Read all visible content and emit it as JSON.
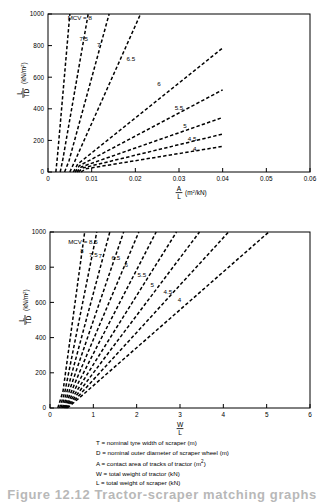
{
  "figure": {
    "caption": "Figure 12.12   Tractor-scraper matching graphs"
  },
  "legend": {
    "items": [
      {
        "symbol": "T",
        "text": "= nominal tyre width of scraper (m)",
        "sup": ""
      },
      {
        "symbol": "D",
        "text": "= nominal outer diameter of scraper wheel (m)",
        "sup": ""
      },
      {
        "symbol": "A",
        "text": "= contact area of tracks of tractor (m",
        "sup": "2",
        "tail": ")"
      },
      {
        "symbol": "W",
        "text": "= total weight of tractor (kN)",
        "sup": ""
      },
      {
        "symbol": "L",
        "text": "= total weight of scraper (kN)",
        "sup": ""
      }
    ]
  },
  "chart_data": [
    {
      "type": "line",
      "id": "upper",
      "title": "",
      "xlabel": "A/L (m2/kN)",
      "xlabel_num": "A",
      "xlabel_den": "L",
      "xlabel_units": "(m2/kN)",
      "ylabel_num": "L",
      "ylabel_den": "TD",
      "ylabel_units": "(kN/m2)",
      "annotation": "MCV = 8",
      "xlim": [
        0,
        0.06
      ],
      "ylim": [
        0,
        1000
      ],
      "xticks": [
        0,
        0.01,
        0.02,
        0.03,
        0.04,
        0.05,
        0.06
      ],
      "xticklabels": [
        "0",
        "0.01",
        "0.02",
        "0.03",
        "0.04",
        "0.05",
        "0.06"
      ],
      "yticks": [
        0,
        200,
        400,
        600,
        800,
        1000
      ],
      "yticklabels": [
        "0",
        "200",
        "400",
        "600",
        "800",
        "1000"
      ],
      "grid": false,
      "legend_position": "inline-curve-labels",
      "linestyle": "dashed",
      "series": [
        {
          "name": "8",
          "label": "MCV = 8",
          "label_xy": [
            0.0045,
            960
          ],
          "x": [
            0.0018,
            0.0022,
            0.005
          ],
          "y": [
            0,
            110,
            1000
          ]
        },
        {
          "name": "7.5",
          "label": "7.5",
          "label_xy": [
            0.0072,
            830
          ],
          "x": [
            0.0028,
            0.0034,
            0.0092
          ],
          "y": [
            0,
            80,
            1000
          ]
        },
        {
          "name": "7",
          "label": "7",
          "label_xy": [
            0.0112,
            790
          ],
          "x": [
            0.0038,
            0.0048,
            0.014
          ],
          "y": [
            0,
            70,
            1000
          ]
        },
        {
          "name": "6.5",
          "label": "6.5",
          "label_xy": [
            0.018,
            700
          ],
          "x": [
            0.005,
            0.006,
            0.0212
          ],
          "y": [
            0,
            60,
            1000
          ]
        },
        {
          "name": "6",
          "label": "6",
          "label_xy": [
            0.025,
            545
          ],
          "x": [
            0.0058,
            0.0068,
            0.04
          ],
          "y": [
            0,
            50,
            785
          ]
        },
        {
          "name": "5.5",
          "label": "5.5",
          "label_xy": [
            0.029,
            390
          ],
          "x": [
            0.0062,
            0.0072,
            0.04
          ],
          "y": [
            0,
            40,
            520
          ]
        },
        {
          "name": "5",
          "label": "5",
          "label_xy": [
            0.031,
            280
          ],
          "x": [
            0.0066,
            0.0076,
            0.04
          ],
          "y": [
            0,
            32,
            345
          ]
        },
        {
          "name": "4.5",
          "label": "4.5",
          "label_xy": [
            0.032,
            195
          ],
          "x": [
            0.007,
            0.008,
            0.04
          ],
          "y": [
            0,
            26,
            240
          ]
        },
        {
          "name": "4",
          "label": "4",
          "label_xy": [
            0.0332,
            130
          ],
          "x": [
            0.0076,
            0.0086,
            0.04
          ],
          "y": [
            0,
            20,
            162
          ]
        }
      ]
    },
    {
      "type": "line",
      "id": "lower",
      "title": "",
      "xlabel_num": "W",
      "xlabel_den": "L",
      "xlabel_units": "",
      "ylabel_num": "L",
      "ylabel_den": "TD",
      "ylabel_units": "(kN/m2)",
      "annotation": "MCV = 8.5",
      "xlim": [
        0,
        6
      ],
      "ylim": [
        0,
        1000
      ],
      "xticks": [
        0,
        1,
        2,
        3,
        4,
        5,
        6
      ],
      "xticklabels": [
        "0",
        "1",
        "2",
        "3",
        "4",
        "5",
        "6"
      ],
      "yticks": [
        0,
        200,
        400,
        600,
        800,
        1000
      ],
      "yticklabels": [
        "0",
        "200",
        "400",
        "600",
        "800",
        "1000"
      ],
      "grid": false,
      "legend_position": "inline-curve-labels",
      "linestyle": "dashed",
      "series": [
        {
          "name": "8.5",
          "label": "MCV = 8.5",
          "label_xy": [
            0.42,
            930
          ],
          "x": [
            0.18,
            0.3,
            0.8
          ],
          "y": [
            0,
            95,
            1000
          ]
        },
        {
          "name": "8",
          "label": "8",
          "label_xy": [
            0.7,
            880
          ],
          "x": [
            0.22,
            0.34,
            1.08
          ],
          "y": [
            0,
            88,
            1000
          ]
        },
        {
          "name": "7.5",
          "label": "7.5",
          "label_xy": [
            0.9,
            860
          ],
          "x": [
            0.25,
            0.38,
            1.38
          ],
          "y": [
            0,
            82,
            1000
          ]
        },
        {
          "name": "7",
          "label": "7",
          "label_xy": [
            1.12,
            855
          ],
          "x": [
            0.28,
            0.42,
            1.7
          ],
          "y": [
            0,
            78,
            1000
          ]
        },
        {
          "name": "6.5",
          "label": "6.5",
          "label_xy": [
            1.42,
            840
          ],
          "x": [
            0.3,
            0.46,
            2.05
          ],
          "y": [
            0,
            74,
            1000
          ]
        },
        {
          "name": "6",
          "label": "6",
          "label_xy": [
            1.72,
            800
          ],
          "x": [
            0.32,
            0.5,
            2.45
          ],
          "y": [
            0,
            70,
            1000
          ]
        },
        {
          "name": "5.5",
          "label": "5.5",
          "label_xy": [
            2.02,
            745
          ],
          "x": [
            0.34,
            0.54,
            2.92
          ],
          "y": [
            0,
            66,
            1000
          ]
        },
        {
          "name": "5",
          "label": "5",
          "label_xy": [
            2.32,
            690
          ],
          "x": [
            0.36,
            0.58,
            3.45
          ],
          "y": [
            0,
            62,
            1000
          ]
        },
        {
          "name": "4.5",
          "label": "4.5",
          "label_xy": [
            2.62,
            645
          ],
          "x": [
            0.38,
            0.62,
            4.12
          ],
          "y": [
            0,
            58,
            1000
          ]
        },
        {
          "name": "4",
          "label": "4",
          "label_xy": [
            2.95,
            605
          ],
          "x": [
            0.4,
            0.66,
            5.05
          ],
          "y": [
            0,
            54,
            1000
          ]
        }
      ]
    }
  ]
}
